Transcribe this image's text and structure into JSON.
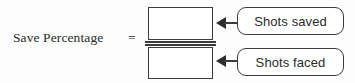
{
  "diagram": {
    "formula": {
      "left_term": "Save Percentage",
      "equals": "=",
      "numerator_value": "",
      "denominator_value": ""
    },
    "callouts": [
      {
        "id": "numerator-callout",
        "label": "Shots saved",
        "points_to": "numerator",
        "arrow": "left-arrow-icon"
      },
      {
        "id": "denominator-callout",
        "label": "Shots faced",
        "points_to": "denominator",
        "arrow": "left-arrow-icon"
      }
    ],
    "colors": {
      "background": "#fdfdfd",
      "stroke": "#3c3c3c",
      "text": "#2b2b2b",
      "box_fill": "#ffffff"
    }
  }
}
